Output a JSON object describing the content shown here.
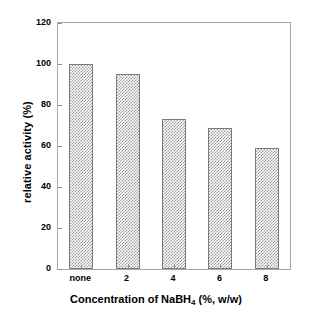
{
  "chart_data": {
    "type": "bar",
    "title": "",
    "subtitle": "",
    "xlabel_prefix": "Concentration of NaBH",
    "xlabel_sub": "4",
    "xlabel_suffix": " (%, w/w)",
    "xlabel": "Concentration of NaBH4 (%, w/w)",
    "ylabel": "relative activity (%)",
    "categories": [
      "none",
      "2",
      "4",
      "6",
      "8"
    ],
    "values": [
      100,
      95,
      73,
      69,
      59
    ],
    "series": [
      {
        "name": "relative activity",
        "values": [
          100,
          95,
          73,
          69,
          59
        ]
      }
    ],
    "ylim": [
      0,
      120
    ],
    "ytick_values": [
      0,
      20,
      40,
      60,
      80,
      100,
      120
    ],
    "ytick_labels": [
      "0",
      "20",
      "40",
      "60",
      "80",
      "100",
      "120"
    ],
    "grid": false,
    "legend": false,
    "legend_position": "none",
    "bar_fill": "#9a9a9a",
    "bar_edge": "#7a7a7a",
    "axis_color": "#a8a8a8",
    "background": "#ffffff",
    "bar_pattern": "checkerboard-dither"
  }
}
